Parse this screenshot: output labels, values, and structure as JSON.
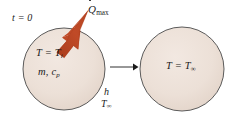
{
  "figure": {
    "background_color": "#ffffff",
    "width": 228,
    "height": 118
  },
  "colors": {
    "sphere_fill": "#ece0d7",
    "sphere_outline": "#4a4a4a",
    "heat_arrow": "#c04a27",
    "heat_arrow_shade": "#a93c1c",
    "transition_arrow": "#1a1a1a",
    "text": "#1a1a1a"
  },
  "labels": {
    "initial_time": "t = 0",
    "heat_flux": "Q",
    "heat_flux_subscript": "max",
    "initial_temperature": "T = T",
    "initial_temperature_subscript": "i",
    "mass_and_specific_heat": "m, c",
    "mass_and_specific_heat_subscript": "p",
    "convection_coefficient": "h",
    "ambient_temperature_left": "T",
    "ambient_temperature_left_subscript": "∞",
    "final_temperature": "T = T",
    "final_temperature_subscript": "∞"
  },
  "shapes": {
    "sphere_left": {
      "cx": 64,
      "cy": 69,
      "r": 41
    },
    "sphere_right": {
      "cx": 182,
      "cy": 69,
      "r": 42
    },
    "transition_arrow": {
      "x1": 110,
      "y1": 67,
      "x2": 136,
      "y2": 67
    },
    "heat_arrow": {
      "tail_x": 58,
      "tail_y": 50,
      "tip_x": 86,
      "tip_y": 10
    }
  }
}
